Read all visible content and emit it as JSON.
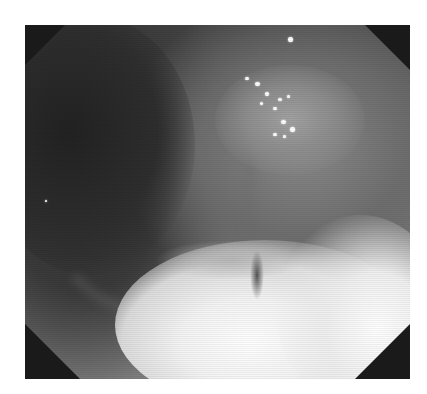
{
  "image": {
    "description": "Grayscale endoscopic photograph of gastrointestinal mucosa with a dark lumen on the left, specular highlights on a raised area at upper center-right, and a bright whitish lesion region along the bottom",
    "mode": "grayscale",
    "frame_shape": "octagonal endoscope view",
    "bounds": {
      "x": 25,
      "y": 25,
      "width": 385,
      "height": 354
    },
    "colors": {
      "background": "#ffffff",
      "frame_corners": "#1b1b1b",
      "lumen": "#2a2a2a",
      "mucosa": "#707070",
      "lesion": "#f4f4f4"
    }
  },
  "caption": {
    "text": ""
  }
}
